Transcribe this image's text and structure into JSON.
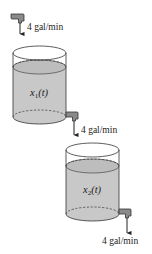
{
  "diagram": {
    "type": "two-tank mixing system",
    "colors": {
      "liquid": "#c8c8c8",
      "liquid_top": "#bdbdbd",
      "outline": "#333333",
      "pipe": "#8a8a8a",
      "background": "#ffffff"
    },
    "inflow": {
      "label": "4 gal/min"
    },
    "tank1": {
      "variable": "x",
      "subscript": "1",
      "argument": "(t)"
    },
    "flow_1_to_2": {
      "label": "4 gal/min"
    },
    "tank2": {
      "variable": "x",
      "subscript": "2",
      "argument": "(t)"
    },
    "outflow": {
      "label": "4 gal/min"
    }
  }
}
